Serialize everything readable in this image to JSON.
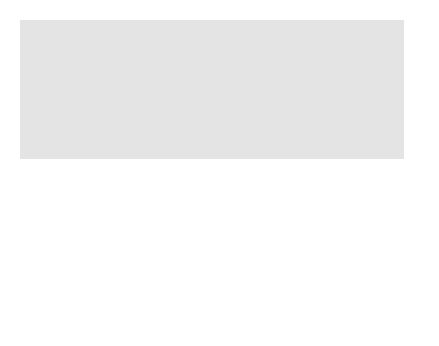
{
  "map": {
    "states": [
      {
        "name": "NEVADA"
      },
      {
        "name": "UTAH"
      },
      {
        "name": "COLORADO"
      },
      {
        "name": "NEW MEXICO"
      }
    ],
    "sites": [
      {
        "site": "Rio Blanco",
        "town": "Rifle"
      },
      {
        "site": "Rulison",
        "town": "Grand Valley"
      },
      {
        "site": "Gasbuggy",
        "town": "Farmington"
      },
      {
        "site": "Gnome",
        "town": "Carlsbad"
      }
    ],
    "nevada_sites": [
      "Sedan",
      "Anacostia",
      "Kaweah"
    ],
    "nevada_town": "Nevada test site",
    "colors": {
      "ocean": "#7a7a7a",
      "land": "#e6e6e6",
      "highlight_state": "#b8b8b8",
      "border": "#ffffff",
      "dot": "#a8a8a8"
    }
  }
}
